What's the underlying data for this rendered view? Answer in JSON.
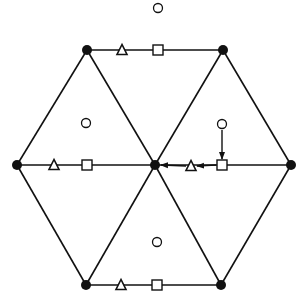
{
  "diagram": {
    "colors": {
      "stroke": "#111111",
      "fill_node": "#111111",
      "fill_open": "#ffffff",
      "background": "#ffffff"
    },
    "nodes": [
      {
        "id": "top-left",
        "x": 87,
        "y": 50,
        "shape": "filled-circle"
      },
      {
        "id": "top-right",
        "x": 223,
        "y": 50,
        "shape": "filled-circle"
      },
      {
        "id": "right",
        "x": 291,
        "y": 165,
        "shape": "filled-circle"
      },
      {
        "id": "bottom-right",
        "x": 221,
        "y": 285,
        "shape": "filled-circle"
      },
      {
        "id": "bottom-left",
        "x": 86,
        "y": 285,
        "shape": "filled-circle"
      },
      {
        "id": "left",
        "x": 17,
        "y": 165,
        "shape": "filled-circle"
      },
      {
        "id": "center",
        "x": 155,
        "y": 165,
        "shape": "filled-circle"
      }
    ],
    "edges": [
      [
        "top-left",
        "top-right"
      ],
      [
        "top-right",
        "right"
      ],
      [
        "right",
        "bottom-right"
      ],
      [
        "bottom-right",
        "bottom-left"
      ],
      [
        "bottom-left",
        "left"
      ],
      [
        "left",
        "top-left"
      ],
      [
        "center",
        "top-left"
      ],
      [
        "center",
        "top-right"
      ],
      [
        "center",
        "right"
      ],
      [
        "center",
        "bottom-right"
      ],
      [
        "center",
        "bottom-left"
      ],
      [
        "center",
        "left"
      ]
    ],
    "edge_markers": [
      {
        "edge": "top",
        "triangle": {
          "x": 122,
          "y": 50
        },
        "square": {
          "x": 158,
          "y": 50
        }
      },
      {
        "edge": "middle-left",
        "triangle": {
          "x": 54,
          "y": 165
        },
        "square": {
          "x": 87,
          "y": 165
        }
      },
      {
        "edge": "middle-right",
        "triangle": {
          "x": 191,
          "y": 166
        },
        "square": {
          "x": 222,
          "y": 165
        }
      },
      {
        "edge": "bottom",
        "triangle": {
          "x": 121,
          "y": 285
        },
        "square": {
          "x": 157,
          "y": 285
        }
      }
    ],
    "cell_markers": [
      {
        "id": "outside-top",
        "x": 158,
        "y": 8,
        "shape": "open-circle"
      },
      {
        "id": "upper-left-cell",
        "x": 86,
        "y": 123,
        "shape": "open-circle"
      },
      {
        "id": "upper-right-cell",
        "x": 222,
        "y": 124,
        "shape": "open-circle"
      },
      {
        "id": "bottom-cell",
        "x": 157,
        "y": 242,
        "shape": "open-circle"
      }
    ],
    "arrows": [
      {
        "from": "upper-right-cell circle",
        "to": "middle-right square",
        "x1": 222,
        "y1": 130,
        "x2": 222,
        "y2": 159
      },
      {
        "from": "middle-right square",
        "to": "middle-right triangle",
        "x1": 216,
        "y1": 165,
        "x2": 197,
        "y2": 166
      },
      {
        "from": "middle-right triangle",
        "to": "center node",
        "x1": 186,
        "y1": 166,
        "x2": 161,
        "y2": 165
      }
    ]
  }
}
